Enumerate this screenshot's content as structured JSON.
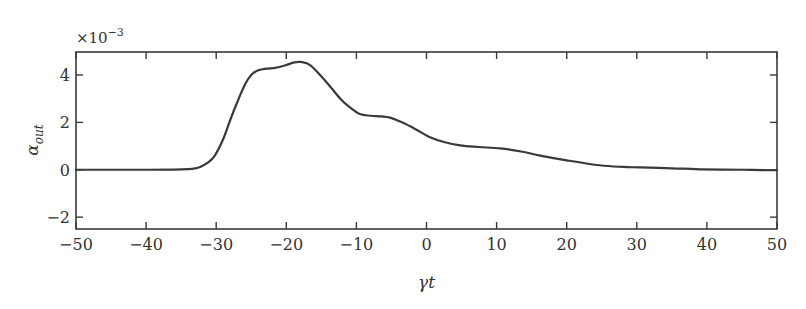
{
  "chart_data": {
    "type": "line",
    "title": "",
    "xlabel": "γt",
    "ylabel_main": "α",
    "ylabel_sub": "out",
    "y_scale_prefix": "×10",
    "y_scale_exponent": "−3",
    "xlim": [
      -50,
      50
    ],
    "ylim": [
      -2.5,
      4.97
    ],
    "x_ticks": [
      -50,
      -40,
      -30,
      -20,
      -10,
      0,
      10,
      20,
      30,
      40,
      50
    ],
    "x_tick_labels": [
      "−50",
      "−40",
      "−30",
      "−20",
      "−10",
      "0",
      "10",
      "20",
      "30",
      "40",
      "50"
    ],
    "y_ticks": [
      -2,
      0,
      2,
      4
    ],
    "y_tick_labels": [
      "−2",
      "0",
      "2",
      "4"
    ],
    "grid": false,
    "legend": "none",
    "series": [
      {
        "name": "alpha_out",
        "color": "#3a3a3a",
        "x": [
          -50,
          -45,
          -40,
          -36,
          -34,
          -33,
          -32.3,
          -31.2,
          -30.2,
          -29,
          -28,
          -27,
          -25.9,
          -25,
          -24,
          -22.8,
          -21.6,
          -20.2,
          -19,
          -18,
          -16.5,
          -14.2,
          -12.3,
          -11,
          -9.5,
          -8,
          -6.5,
          -5.2,
          -3.5,
          -1.5,
          0.5,
          2.5,
          4.8,
          7.5,
          10.5,
          13.5,
          16.2,
          20,
          24.7,
          28,
          30.5,
          35,
          39,
          45,
          50
        ],
        "y": [
          0,
          0,
          0,
          0.01,
          0.03,
          0.06,
          0.12,
          0.3,
          0.6,
          1.3,
          2.1,
          2.85,
          3.6,
          4.0,
          4.2,
          4.27,
          4.3,
          4.4,
          4.52,
          4.55,
          4.4,
          3.67,
          3.0,
          2.65,
          2.35,
          2.28,
          2.25,
          2.2,
          2.0,
          1.7,
          1.37,
          1.17,
          1.03,
          0.96,
          0.9,
          0.77,
          0.6,
          0.4,
          0.19,
          0.12,
          0.1,
          0.06,
          0.02,
          0.0,
          -0.02
        ]
      }
    ]
  }
}
